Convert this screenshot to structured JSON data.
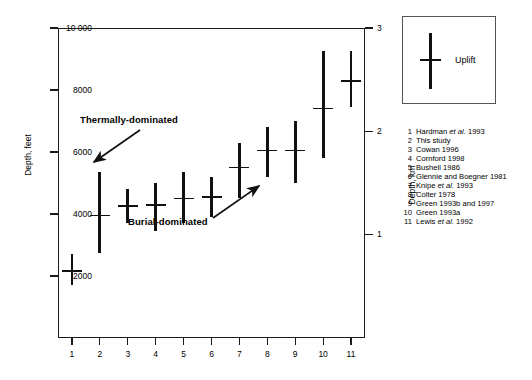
{
  "chart_data": {
    "type": "scatter",
    "title": "",
    "xlabel": "",
    "ylabel": "Depth, feet",
    "ylabel_right": "Depth, km",
    "categories": [
      "1",
      "2",
      "3",
      "4",
      "5",
      "6",
      "7",
      "8",
      "9",
      "10",
      "11"
    ],
    "ylim": [
      0,
      10000
    ],
    "ylim_right": [
      0,
      3
    ],
    "yticks": [
      "2000",
      "4000",
      "6000",
      "8000",
      "10 000"
    ],
    "ytick_values": [
      2000,
      4000,
      6000,
      8000,
      10000
    ],
    "yticks_right": [
      "1",
      "2",
      "3"
    ],
    "ytick_values_right": [
      1,
      2,
      3
    ],
    "grid": false,
    "legend_position": "outside-top-right",
    "series": [
      {
        "name": "Uplift",
        "points": [
          {
            "x": "1",
            "value": 2150,
            "low": 1700,
            "high": 2700
          },
          {
            "x": "2",
            "value": 3950,
            "low": 2750,
            "high": 5350
          },
          {
            "x": "3",
            "value": 4250,
            "low": 3700,
            "high": 4800
          },
          {
            "x": "4",
            "value": 4300,
            "low": 3450,
            "high": 5000
          },
          {
            "x": "5",
            "value": 4500,
            "low": 3700,
            "high": 5350
          },
          {
            "x": "6",
            "value": 4550,
            "low": 3900,
            "high": 5200
          },
          {
            "x": "7",
            "value": 5500,
            "low": 4500,
            "high": 6300
          },
          {
            "x": "8",
            "value": 6050,
            "low": 5200,
            "high": 6800
          },
          {
            "x": "9",
            "value": 6050,
            "low": 5000,
            "high": 7000
          },
          {
            "x": "10",
            "value": 7400,
            "low": 5800,
            "high": 9250
          },
          {
            "x": "11",
            "value": 8300,
            "low": 7450,
            "high": 9250
          }
        ]
      }
    ],
    "annotations": [
      {
        "text": "Thermally-dominated",
        "arrow": "down-left"
      },
      {
        "text": "Burial-dominated",
        "arrow": "up-right"
      }
    ]
  },
  "legend": {
    "symbol_name": "uplift-range-bar",
    "label": "Uplift"
  },
  "references": [
    {
      "num": "1",
      "text": "Hardman ",
      "italic": "et al.",
      "tail": " 1993"
    },
    {
      "num": "2",
      "text": "This study",
      "italic": "",
      "tail": ""
    },
    {
      "num": "3",
      "text": "Cowan  1996",
      "italic": "",
      "tail": ""
    },
    {
      "num": "4",
      "text": "Cornford 1998",
      "italic": "",
      "tail": ""
    },
    {
      "num": "5",
      "text": "Bushell 1986",
      "italic": "",
      "tail": ""
    },
    {
      "num": "6",
      "text": "Glennie and Boegner 1981",
      "italic": "",
      "tail": ""
    },
    {
      "num": "7",
      "text": "Knipe ",
      "italic": "et al.",
      "tail": " 1993"
    },
    {
      "num": "8",
      "text": "Colter 1978",
      "italic": "",
      "tail": ""
    },
    {
      "num": "9",
      "text": "Green 1993b and 1997",
      "italic": "",
      "tail": ""
    },
    {
      "num": "10",
      "text": "Green 1993a",
      "italic": "",
      "tail": ""
    },
    {
      "num": "11",
      "text": "Lewis ",
      "italic": "et al.",
      "tail": " 1992"
    }
  ],
  "colors": {
    "mark": "#111111",
    "frame": "#1a1a1a",
    "legend_border": "#555555",
    "background": "#ffffff"
  }
}
